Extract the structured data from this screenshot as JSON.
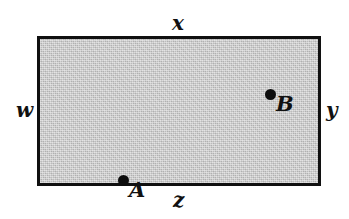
{
  "figure": {
    "background_color": "#ffffff",
    "shape": {
      "type": "rectangle",
      "fill_color": "#c9c9c9",
      "stroke_color": "#101010",
      "stroke_width": 3
    },
    "edge_labels": {
      "top": "x",
      "bottom": "z",
      "left": "w",
      "right": "y"
    },
    "points": [
      {
        "label": "A",
        "marker": "filled-circle",
        "color": "#0d0d0d"
      },
      {
        "label": "B",
        "marker": "filled-circle",
        "color": "#0d0d0d"
      }
    ]
  }
}
